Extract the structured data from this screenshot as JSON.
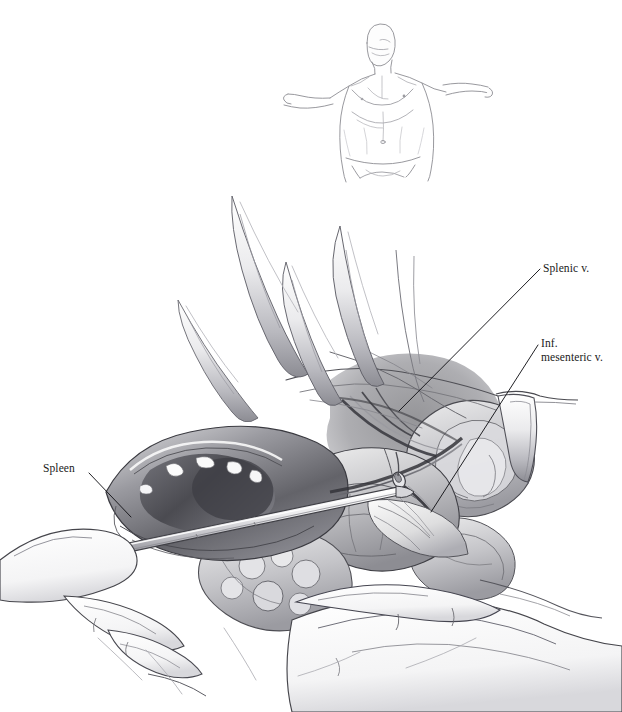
{
  "plate": {
    "kind": "surgical-anatomy-illustration",
    "medium": "graphite pencil drawing",
    "background_color": "#ffffff",
    "ink_color": "#1a1a1a",
    "width": 622,
    "height": 712
  },
  "orientation_figure": {
    "name": "male-torso-orientation-figure",
    "description": "Light line drawing of a male torso, head turned, both arms outstretched laterally",
    "stroke_color": "#8a8a90"
  },
  "operative_field": {
    "name": "operative-field",
    "description": "Open abdominal exposure with retractors, surgeon's hands, spleen and pancreatic bed"
  },
  "labels": [
    {
      "id": "spleen",
      "name": "label-spleen",
      "text": "Spleen",
      "lines": [
        "Spleen"
      ],
      "x": 43,
      "y": 462,
      "leader": {
        "x1": 89,
        "y1": 473,
        "x2": 131,
        "y2": 517
      }
    },
    {
      "id": "splenic-vein",
      "name": "label-splenic-vein",
      "text": "Splenic v.",
      "lines": [
        "Splenic v."
      ],
      "x": 543,
      "y": 262,
      "leader": {
        "x1": 540,
        "y1": 269,
        "x2": 399,
        "y2": 411
      }
    },
    {
      "id": "inf-mesenteric-vein",
      "name": "label-inf-mesenteric-vein",
      "text": "Inf. mesenteric v.",
      "lines": [
        "Inf.",
        "mesenteric v."
      ],
      "x": 541,
      "y": 337,
      "leader": {
        "x1": 538,
        "y1": 345,
        "x2": 431,
        "y2": 512
      }
    }
  ],
  "instruments": [
    {
      "name": "dissecting-forceps",
      "description": "Long straight forceps entering from lower left across the splenic hilum"
    },
    {
      "name": "retractor-blade-right",
      "description": "Malleable retractor blade at right margin of the wound"
    },
    {
      "name": "retractor-blades-upper",
      "description": "Narrow retractor blades lifting the upper wound edge"
    }
  ],
  "hands": [
    {
      "name": "surgeon-hand-left",
      "description": "Hand at lower left supporting the spleen"
    },
    {
      "name": "surgeon-hand-right",
      "description": "Hand at lower right retracting bowel"
    }
  ]
}
